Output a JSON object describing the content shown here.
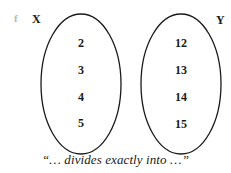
{
  "diagram": {
    "function_label": "f",
    "domain_set": {
      "label": "X",
      "elements": [
        "2",
        "3",
        "4",
        "5"
      ]
    },
    "codomain_set": {
      "label": "Y",
      "elements": [
        "12",
        "13",
        "14",
        "15"
      ]
    },
    "caption": "“… divides exactly into …”",
    "colors": {
      "ink": "#1a1a1a",
      "function_label": "#b8b8b8",
      "background": "#ffffff"
    }
  }
}
